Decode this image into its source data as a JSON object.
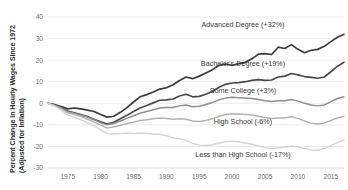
{
  "chart_data": {
    "type": "line",
    "title": "",
    "xlabel": "",
    "ylabel": "Percent Change in Hourly Wages Since 1972 (Adjusted for Inflation)",
    "ylabel_line1": "Percent Change in Hourly Wages Since 1972",
    "ylabel_line2": "(Adjusted for Inflation)",
    "xlim": [
      1972,
      2017
    ],
    "ylim": [
      -30,
      40
    ],
    "grid": true,
    "legend_position": "inline-annotations",
    "yticks": [
      40,
      30,
      20,
      10,
      0,
      -10,
      -20,
      -30
    ],
    "ytick_labels": [
      "40",
      "30",
      "20",
      "10",
      "0",
      "-10",
      "-20",
      "-30"
    ],
    "xticks": [
      1975,
      1980,
      1985,
      1990,
      1995,
      2000,
      2005,
      2010,
      2015
    ],
    "xtick_labels": [
      "1975",
      "1980",
      "1985",
      "1990",
      "1995",
      "2000",
      "2005",
      "2010",
      "2015"
    ],
    "x": [
      1972,
      1973,
      1974,
      1975,
      1976,
      1977,
      1978,
      1979,
      1980,
      1981,
      1982,
      1983,
      1984,
      1985,
      1986,
      1987,
      1988,
      1989,
      1990,
      1991,
      1992,
      1993,
      1994,
      1995,
      1996,
      1997,
      1998,
      1999,
      2000,
      2001,
      2002,
      2003,
      2004,
      2005,
      2006,
      2007,
      2008,
      2009,
      2010,
      2011,
      2012,
      2013,
      2014,
      2015,
      2016,
      2017
    ],
    "series": [
      {
        "name": "Advanced Degree",
        "label": "Advanced Degree (+32%)",
        "end_value": 32,
        "color": "#3b3b3b",
        "width": 1.7,
        "label_x": 243,
        "label_y": 27,
        "values": [
          0,
          -0.6,
          -1.5,
          -2.6,
          -2.2,
          -2.6,
          -3.2,
          -3.8,
          -5.2,
          -6.4,
          -6.0,
          -4.2,
          -2.0,
          0.6,
          3.0,
          4.0,
          5.2,
          6.6,
          7.2,
          8.6,
          10.6,
          12.2,
          11.4,
          12.6,
          14.0,
          15.6,
          17.6,
          18.2,
          17.6,
          18.4,
          19.0,
          20.6,
          22.8,
          23.0,
          22.6,
          26.0,
          25.4,
          27.2,
          25.0,
          23.4,
          24.6,
          25.0,
          26.4,
          28.6,
          30.6,
          32.0
        ]
      },
      {
        "name": "Bachelor's Degree",
        "label": "Bachelor's Degree (+19%)",
        "end_value": 19,
        "color": "#4a4a4a",
        "width": 1.7,
        "label_x": 243,
        "label_y": 66,
        "values": [
          0,
          -0.8,
          -2.0,
          -3.6,
          -4.4,
          -5.2,
          -6.2,
          -7.4,
          -8.6,
          -9.6,
          -8.8,
          -7.2,
          -5.6,
          -3.8,
          -2.2,
          -1.0,
          0.2,
          1.4,
          1.6,
          2.0,
          3.4,
          4.2,
          3.0,
          3.2,
          4.2,
          5.6,
          7.4,
          8.8,
          9.4,
          9.6,
          10.0,
          10.6,
          11.0,
          10.6,
          10.8,
          12.2,
          12.6,
          13.8,
          13.2,
          12.4,
          12.0,
          11.6,
          12.2,
          14.6,
          17.2,
          19.0
        ]
      },
      {
        "name": "Some College",
        "label": "Some College (+3%)",
        "end_value": 3,
        "color": "#8f8f8f",
        "width": 1.5,
        "label_x": 243,
        "label_y": 93,
        "values": [
          0,
          -0.9,
          -2.2,
          -3.9,
          -4.6,
          -5.4,
          -6.4,
          -7.6,
          -9.0,
          -10.0,
          -9.4,
          -8.2,
          -7.0,
          -5.8,
          -4.6,
          -3.8,
          -3.0,
          -2.2,
          -2.0,
          -2.0,
          -1.2,
          -0.8,
          -1.6,
          -1.4,
          -0.6,
          0.4,
          1.6,
          2.4,
          2.8,
          2.6,
          2.4,
          2.2,
          1.8,
          1.2,
          0.8,
          1.2,
          1.2,
          1.8,
          1.0,
          0.0,
          -0.8,
          -1.2,
          -0.8,
          0.8,
          2.2,
          3.0
        ]
      },
      {
        "name": "High School",
        "label": "High School (-6%)",
        "end_value": -6,
        "color": "#b3b3b3",
        "width": 1.5,
        "label_x": 243,
        "label_y": 124,
        "values": [
          0,
          -1.1,
          -2.6,
          -4.4,
          -5.2,
          -6.2,
          -7.4,
          -8.6,
          -10.2,
          -11.4,
          -11.0,
          -10.2,
          -9.4,
          -8.8,
          -8.0,
          -7.6,
          -7.2,
          -6.8,
          -7.0,
          -7.4,
          -7.2,
          -7.4,
          -8.2,
          -8.4,
          -8.0,
          -7.2,
          -6.0,
          -5.2,
          -4.8,
          -5.0,
          -5.2,
          -5.4,
          -6.0,
          -6.6,
          -7.0,
          -6.8,
          -6.8,
          -6.2,
          -7.0,
          -8.2,
          -9.2,
          -9.6,
          -9.2,
          -8.0,
          -6.8,
          -6.0
        ]
      },
      {
        "name": "Less than High School",
        "label": "Less than High School (-17%)",
        "end_value": -17,
        "color": "#d6d6d6",
        "width": 1.5,
        "label_x": 243,
        "label_y": 157,
        "values": [
          0,
          -1.4,
          -3.2,
          -5.4,
          -6.4,
          -7.6,
          -9.0,
          -10.4,
          -12.4,
          -14.0,
          -14.2,
          -14.0,
          -13.8,
          -14.0,
          -13.8,
          -14.0,
          -14.2,
          -14.4,
          -15.0,
          -16.0,
          -16.4,
          -17.2,
          -18.6,
          -19.4,
          -19.6,
          -19.2,
          -18.4,
          -17.8,
          -17.6,
          -18.0,
          -18.4,
          -19.0,
          -19.8,
          -20.6,
          -21.0,
          -20.6,
          -20.4,
          -19.8,
          -20.2,
          -21.0,
          -21.6,
          -21.8,
          -21.0,
          -19.6,
          -18.2,
          -17.0
        ]
      }
    ]
  }
}
